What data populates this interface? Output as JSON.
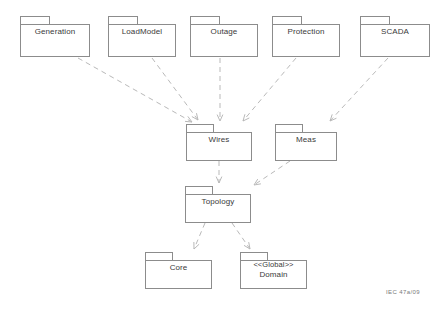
{
  "diagram": {
    "caption": "IEC   47а/09",
    "background_color": "#ffffff",
    "box_border_color": "#8c8c8c",
    "edge_color": "#b9b9b9",
    "text_color": "#3a3a3a"
  },
  "packages": [
    {
      "id": "generation",
      "label": "Generation",
      "stereotype": "",
      "x": 20,
      "y": 16,
      "w": 70,
      "h": 41,
      "tab_w": 30
    },
    {
      "id": "loadmodel",
      "label": "LoadModel",
      "stereotype": "",
      "x": 108,
      "y": 16,
      "w": 68,
      "h": 41,
      "tab_w": 30
    },
    {
      "id": "outage",
      "label": "Outage",
      "stereotype": "",
      "x": 190,
      "y": 16,
      "w": 68,
      "h": 41,
      "tab_w": 30
    },
    {
      "id": "protection",
      "label": "Protection",
      "stereotype": "",
      "x": 272,
      "y": 16,
      "w": 68,
      "h": 41,
      "tab_w": 30
    },
    {
      "id": "scada",
      "label": "SCADA",
      "stereotype": "",
      "x": 360,
      "y": 16,
      "w": 70,
      "h": 41,
      "tab_w": 30
    },
    {
      "id": "wires",
      "label": "Wires",
      "stereotype": "",
      "x": 186,
      "y": 124,
      "w": 66,
      "h": 37,
      "tab_w": 28
    },
    {
      "id": "meas",
      "label": "Meas",
      "stereotype": "",
      "x": 275,
      "y": 124,
      "w": 62,
      "h": 37,
      "tab_w": 28
    },
    {
      "id": "topology",
      "label": "Topology",
      "stereotype": "",
      "x": 185,
      "y": 186,
      "w": 66,
      "h": 37,
      "tab_w": 28
    },
    {
      "id": "core",
      "label": "Core",
      "stereotype": "",
      "x": 145,
      "y": 252,
      "w": 67,
      "h": 37,
      "tab_w": 28
    },
    {
      "id": "domain",
      "label": "Domain",
      "stereotype": "<<Global>>",
      "x": 240,
      "y": 252,
      "w": 67,
      "h": 37,
      "tab_w": 28
    }
  ],
  "dependencies": [
    {
      "id": "generation-to-wires",
      "from": "Generation",
      "to": "Wires",
      "x1": 78,
      "y1": 58,
      "x2": 192,
      "y2": 122
    },
    {
      "id": "loadmodel-to-wires",
      "from": "LoadModel",
      "to": "Wires",
      "x1": 152,
      "y1": 58,
      "x2": 198,
      "y2": 120
    },
    {
      "id": "outage-to-wires",
      "from": "Outage",
      "to": "Wires",
      "x1": 220,
      "y1": 58,
      "x2": 220,
      "y2": 121
    },
    {
      "id": "protection-to-wires",
      "from": "Protection",
      "to": "Wires",
      "x1": 296,
      "y1": 58,
      "x2": 243,
      "y2": 121
    },
    {
      "id": "scada-to-meas",
      "from": "SCADA",
      "to": "Meas",
      "x1": 388,
      "y1": 58,
      "x2": 330,
      "y2": 121
    },
    {
      "id": "wires-to-topology",
      "from": "Wires",
      "to": "Topology",
      "x1": 219,
      "y1": 161,
      "x2": 219,
      "y2": 183
    },
    {
      "id": "meas-to-topology",
      "from": "Meas",
      "to": "Topology",
      "x1": 290,
      "y1": 161,
      "x2": 254,
      "y2": 185
    },
    {
      "id": "topology-to-core",
      "from": "Topology",
      "to": "Core",
      "x1": 205,
      "y1": 223,
      "x2": 194,
      "y2": 249
    },
    {
      "id": "topology-to-domain",
      "from": "Topology",
      "to": "Domain",
      "x1": 232,
      "y1": 223,
      "x2": 250,
      "y2": 249
    }
  ]
}
